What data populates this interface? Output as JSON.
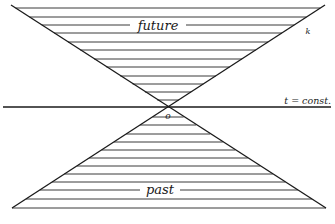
{
  "diagram": {
    "labels": {
      "future": "future",
      "past": "past",
      "origin": "o",
      "time_slice": "t = const.",
      "cone_edge": "k"
    },
    "colors": {
      "background": "#ffffff",
      "ink": "#1a1a1a",
      "hatch": "#3a3a3a"
    },
    "geometry": {
      "apex": [
        168,
        107
      ],
      "top_left": [
        11,
        5
      ],
      "top_right": [
        325,
        5
      ],
      "bottom_left": [
        12,
        208
      ],
      "bottom_right": [
        326,
        208
      ],
      "time_axis_y": 107,
      "time_axis_x": [
        3,
        331
      ]
    },
    "future_hatch_y": [
      8,
      17,
      25,
      33,
      42,
      50,
      59,
      67,
      76,
      84,
      92,
      100
    ],
    "past_hatch_y": [
      117,
      125,
      134,
      142,
      150,
      158,
      166,
      174,
      182,
      190,
      199,
      208
    ],
    "future_label_gap": {
      "y": 25,
      "x1": 130,
      "x2": 186
    },
    "past_label_gap": {
      "y": 190,
      "x1": 140,
      "x2": 180
    }
  }
}
